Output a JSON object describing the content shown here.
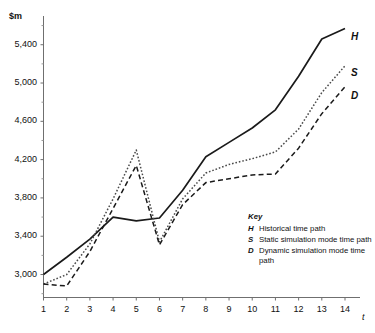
{
  "chart_data": {
    "type": "line",
    "title": "",
    "xlabel": "t",
    "ylabel": "$m",
    "x": [
      1,
      2,
      3,
      4,
      5,
      6,
      7,
      8,
      9,
      10,
      11,
      12,
      13,
      14
    ],
    "xlim": [
      1,
      14
    ],
    "ylim": [
      2760,
      5700
    ],
    "grid": false,
    "legend_position": "inside-lower-right",
    "y_ticks_major": [
      3000,
      3400,
      3800,
      4200,
      4600,
      5000,
      5400
    ],
    "y_tick_labels": [
      "3,000",
      "3,400",
      "3,800",
      "4,200",
      "4,600",
      "5,000",
      "5,400"
    ],
    "y_ticks_minor": [
      2800,
      3200,
      3600,
      4000,
      4400,
      4800,
      5200,
      5600
    ],
    "x_tick_labels": [
      "1",
      "2",
      "3",
      "4",
      "5",
      "6",
      "7",
      "8",
      "9",
      "10",
      "11",
      "12",
      "13",
      "14"
    ],
    "series": [
      {
        "name": "H",
        "label": "Historical time path",
        "style": "solid",
        "color": "#1a1a1a",
        "values": [
          3000,
          3180,
          3370,
          3600,
          3560,
          3590,
          3880,
          4230,
          4380,
          4530,
          4720,
          5070,
          5460,
          5570
        ]
      },
      {
        "name": "S",
        "label": "Static simulation mode time path",
        "style": "dotted",
        "color": "#4a4a4a",
        "values": [
          2900,
          3000,
          3320,
          3790,
          4300,
          3340,
          3790,
          4060,
          4150,
          4210,
          4280,
          4520,
          4900,
          5180
        ]
      },
      {
        "name": "D",
        "label": "Dynamic simulation mode time path",
        "style": "dashed",
        "color": "#1a1a1a",
        "values": [
          2900,
          2880,
          3240,
          3690,
          4140,
          3310,
          3730,
          3960,
          4000,
          4040,
          4050,
          4320,
          4680,
          4960
        ]
      }
    ]
  },
  "axis": {
    "y_unit": "$m",
    "x_var": "t"
  },
  "legend": {
    "title": "Key",
    "entries": [
      {
        "key": "H",
        "desc": "Historical time path"
      },
      {
        "key": "S",
        "desc": "Static simulation mode time path"
      },
      {
        "key": "D",
        "desc": "Dynamic simulation mode time path"
      }
    ]
  },
  "end_labels": {
    "h": "H",
    "s": "S",
    "d": "D"
  }
}
